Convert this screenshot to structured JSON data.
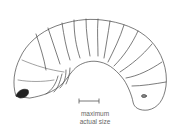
{
  "scale_bar": {
    "line1": "maximum",
    "line2": "actual size"
  },
  "colors": {
    "outline": "#444444",
    "head": "#222222",
    "text": "#666666",
    "background": "#ffffff"
  }
}
